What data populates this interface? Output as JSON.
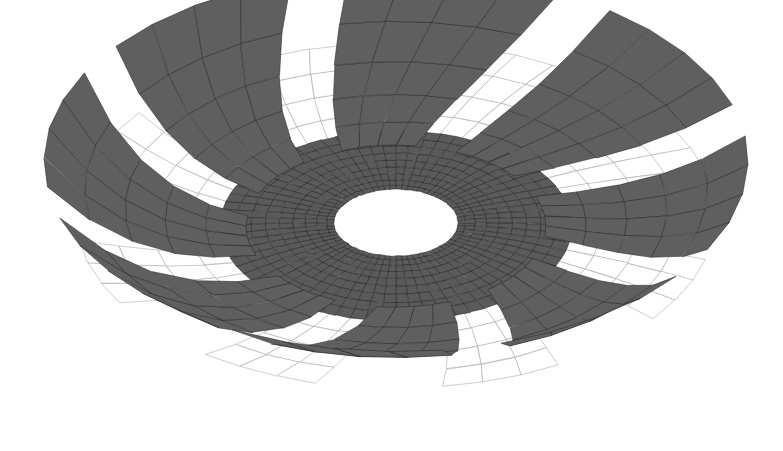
{
  "scene": {
    "title": "Impeller Rotor Quad Mesh",
    "background_color": "#ffffff",
    "view": "isometric-perspective",
    "width": 783,
    "height": 451
  },
  "colors": {
    "front_face_fill": "#5f5f5f",
    "front_face_edge": "#2a2a2a",
    "back_face_fill": "#ffffff",
    "back_face_edge": "#9a9a9a",
    "hub_face_fill": "#5a5a5a",
    "hub_face_edge": "#232323",
    "bore_fill": "#ffffff"
  },
  "geometry": {
    "center_x": 396,
    "center_y": 226,
    "squash_y": 0.54,
    "bore_radius": 59,
    "hub_inner_radius": 62,
    "hub_outer_radius": 176,
    "hub_radial_divisions": 9,
    "hub_angular_divisions": 72,
    "blade_count": 8,
    "blade_start_angle_deg": -97,
    "blade_half_width_deg": 15.5,
    "blade_inner_radius": 150,
    "blade_outer_radius": 352,
    "blade_span_divisions": 5,
    "blade_chord_divisions": 4,
    "blade_twist_deg": 17,
    "blade_lift": 0.34,
    "back_sheet_offset_deg": -20,
    "back_sheet_half_width_deg": 11,
    "back_sheet_inner_radius": 168,
    "back_sheet_outer_radius": 320,
    "back_sheet_span_divisions": 4,
    "back_sheet_chord_divisions": 3,
    "back_sheet_lift": 0.06
  },
  "chart_data": {
    "type": "scatter",
    "xlabel": "",
    "ylabel": ""
  }
}
